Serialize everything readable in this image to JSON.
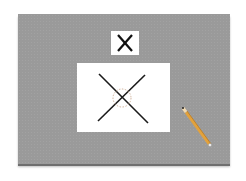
{
  "scene": {
    "board_color": "#9a9a9a",
    "card_symbol": "cross",
    "paper_symbol": "cross",
    "highlight": "dashed-circle-at-intersection",
    "highlight_color": "#c8a890",
    "tool": "pencil",
    "pencil_color": "#e0a040"
  }
}
